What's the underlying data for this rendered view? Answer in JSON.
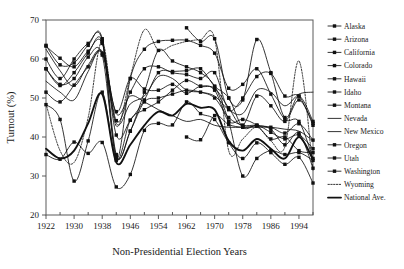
{
  "chart_data": {
    "type": "line",
    "title": "",
    "xlabel": "Non-Presidential Election Years",
    "ylabel": "Turnout (%)",
    "xlim": [
      1922,
      1998
    ],
    "ylim": [
      20,
      70
    ],
    "yticks": [
      20,
      30,
      40,
      50,
      60,
      70
    ],
    "xticks": [
      1922,
      1930,
      1938,
      1946,
      1954,
      1962,
      1970,
      1978,
      1986,
      1994
    ],
    "xticks_minor": [
      1926,
      1934,
      1942,
      1950,
      1958,
      1966,
      1974,
      1982,
      1990,
      1998
    ],
    "grid": false,
    "legend_position": "right",
    "x": [
      1922,
      1926,
      1930,
      1934,
      1938,
      1942,
      1946,
      1950,
      1954,
      1958,
      1962,
      1966,
      1970,
      1974,
      1978,
      1982,
      1986,
      1990,
      1994,
      1998
    ],
    "series": [
      {
        "name": "Alaska",
        "marker": "square",
        "line": "solid",
        "values": [
          null,
          null,
          null,
          null,
          null,
          null,
          null,
          null,
          null,
          null,
          40.0,
          39.3,
          45.5,
          43.2,
          42.5,
          42.8,
          42.5,
          41.0,
          43.4,
          39.2
        ]
      },
      {
        "name": "Arizona",
        "marker": "square",
        "line": "solid",
        "values": [
          35.5,
          34.3,
          38.7,
          35.8,
          38.6,
          27.2,
          30.4,
          41.7,
          43.5,
          43.1,
          49.0,
          46.0,
          44.5,
          38.5,
          34.5,
          38.5,
          36.0,
          33.0,
          34.8,
          28.2
        ]
      },
      {
        "name": "California",
        "marker": "square",
        "line": "solid",
        "values": [
          51.5,
          49.0,
          53.3,
          58.0,
          61.5,
          46.5,
          55.0,
          52.3,
          52.0,
          53.5,
          51.2,
          53.0,
          52.0,
          44.0,
          44.5,
          43.0,
          39.5,
          40.0,
          36.5,
          36.0
        ]
      },
      {
        "name": "Colorado",
        "marker": "square",
        "line": "solid",
        "values": [
          57.5,
          53.2,
          56.5,
          61.5,
          64.5,
          40.5,
          44.3,
          49.5,
          56.5,
          56.8,
          57.0,
          57.5,
          53.0,
          50.0,
          42.5,
          43.0,
          41.2,
          39.5,
          40.5,
          37.0
        ]
      },
      {
        "name": "Hawaii",
        "marker": "square",
        "line": "solid",
        "values": [
          null,
          null,
          null,
          null,
          null,
          null,
          null,
          null,
          null,
          null,
          68.0,
          64.5,
          65.2,
          50.0,
          49.5,
          65.0,
          56.5,
          45.0,
          50.5,
          44.0
        ]
      },
      {
        "name": "Idaho",
        "marker": "square",
        "line": "solid",
        "values": [
          63.5,
          58.5,
          59.0,
          63.5,
          65.2,
          34.5,
          55.0,
          62.5,
          64.5,
          64.8,
          64.8,
          63.5,
          61.5,
          52.5,
          53.5,
          57.5,
          51.0,
          44.5,
          44.0,
          34.5
        ]
      },
      {
        "name": "Montana",
        "marker": "square",
        "line": "solid",
        "values": [
          63.3,
          60.2,
          58.0,
          62.0,
          64.0,
          44.2,
          51.5,
          57.5,
          58.0,
          56.5,
          56.0,
          55.0,
          56.5,
          47.0,
          50.0,
          55.5,
          56.3,
          50.5,
          50.5,
          43.0
        ]
      },
      {
        "name": "Nevada",
        "marker": "none",
        "line": "solid",
        "values": [
          54.3,
          51.5,
          49.5,
          56.8,
          62.0,
          46.0,
          50.5,
          49.0,
          47.0,
          45.5,
          44.0,
          44.5,
          43.0,
          42.5,
          42.5,
          42.5,
          42.5,
          42.0,
          41.5,
          39.0
        ]
      },
      {
        "name": "New Mexico",
        "marker": "none",
        "line": "solid",
        "values": [
          62.5,
          57.0,
          53.0,
          58.5,
          61.5,
          43.5,
          48.5,
          50.5,
          55.5,
          55.0,
          52.0,
          51.5,
          50.5,
          47.0,
          46.0,
          52.0,
          51.5,
          48.0,
          51.0,
          51.5
        ]
      },
      {
        "name": "Oregon",
        "marker": "square",
        "line": "solid",
        "values": [
          48.3,
          44.5,
          28.7,
          39.0,
          51.5,
          34.0,
          44.3,
          47.0,
          49.0,
          52.0,
          54.5,
          53.0,
          52.5,
          47.5,
          43.0,
          50.5,
          48.0,
          44.0,
          49.5,
          43.5
        ]
      },
      {
        "name": "Utah",
        "marker": "square",
        "line": "solid",
        "values": [
          60.0,
          55.0,
          60.0,
          64.0,
          64.8,
          35.5,
          41.5,
          51.5,
          62.2,
          59.5,
          58.0,
          56.5,
          53.0,
          44.0,
          30.0,
          34.5,
          36.5,
          35.5,
          36.0,
          34.0
        ]
      },
      {
        "name": "Washington",
        "marker": "square",
        "line": "solid",
        "values": [
          57.5,
          53.5,
          55.0,
          60.5,
          61.0,
          35.0,
          41.5,
          49.0,
          50.0,
          51.0,
          52.0,
          51.5,
          50.0,
          45.0,
          43.0,
          43.0,
          42.0,
          38.0,
          41.0,
          32.0
        ]
      },
      {
        "name": "Wyoming",
        "marker": "none",
        "line": "dotted",
        "values": [
          48.5,
          36.5,
          33.5,
          45.0,
          64.5,
          42.8,
          55.5,
          67.5,
          62.3,
          63.5,
          64.5,
          65.0,
          65.2,
          36.5,
          39.5,
          42.5,
          39.0,
          37.5,
          59.5,
          31.5
        ]
      },
      {
        "name": "National Ave.",
        "marker": "none",
        "line": "thick",
        "values": [
          37.0,
          34.5,
          36.5,
          43.5,
          51.0,
          33.5,
          38.0,
          43.0,
          46.5,
          45.5,
          48.5,
          47.5,
          47.0,
          39.0,
          36.5,
          39.5,
          37.0,
          34.5,
          40.0,
          34.2
        ]
      }
    ]
  },
  "legend": {
    "items": [
      {
        "label": "Alaska"
      },
      {
        "label": "Arizona"
      },
      {
        "label": "California"
      },
      {
        "label": "Colorado"
      },
      {
        "label": "Hawaii"
      },
      {
        "label": "Idaho"
      },
      {
        "label": "Montana"
      },
      {
        "label": "Nevada"
      },
      {
        "label": "New Mexico"
      },
      {
        "label": "Oregon"
      },
      {
        "label": "Utah"
      },
      {
        "label": "Washington"
      },
      {
        "label": "Wyoming"
      },
      {
        "label": "National Ave."
      }
    ]
  },
  "colors": {
    "ink": "#111111",
    "frame": "#5a5a5a",
    "background": "#ffffff"
  }
}
